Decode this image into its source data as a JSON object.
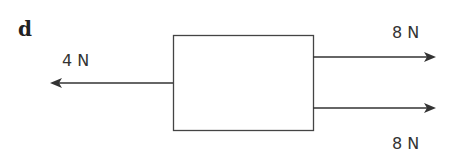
{
  "figure": {
    "panel_label": "d",
    "forces": [
      {
        "label": "4 N",
        "direction": "left"
      },
      {
        "label": "8 N",
        "direction": "right"
      },
      {
        "label": "8 N",
        "direction": "right"
      }
    ],
    "colors": {
      "line": "#333333",
      "background": "#ffffff"
    }
  }
}
